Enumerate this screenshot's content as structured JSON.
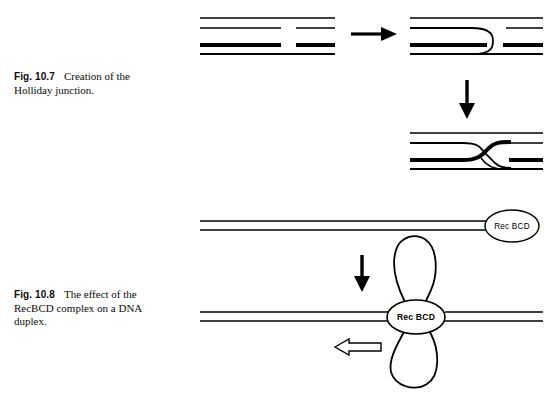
{
  "page": {
    "width": 547,
    "height": 398,
    "background": "#ffffff",
    "ink": "#000000"
  },
  "figures": [
    {
      "id": "fig-10-7",
      "number": "Fig. 10.7",
      "caption": "Creation of the Holliday junction.",
      "caption_line1": "Creation of the",
      "caption_line2": "Holliday junction.",
      "panels": [
        {
          "name": "parental-duplexes",
          "description": "Two separate DNA duplexes drawn as parallel line pairs; upper duplex drawn thin, lower duplex drawn thick; each carries a single-strand nick",
          "duplexes": [
            {
              "style": "thin",
              "nick_strand": "bottom"
            },
            {
              "style": "thick",
              "nick_strand": "top"
            }
          ]
        },
        {
          "name": "single-strand-invasion",
          "description": "Thin strand crosses over and pairs with the thick duplex forming a single crossover"
        },
        {
          "name": "holliday-junction",
          "description": "Reciprocal strand exchange producing the S-shaped Holliday junction"
        }
      ],
      "arrows": [
        {
          "name": "horizontal-arrow",
          "direction": "right",
          "style": "solid"
        },
        {
          "name": "vertical-arrow",
          "direction": "down",
          "style": "solid"
        }
      ]
    },
    {
      "id": "fig-10-8",
      "number": "Fig. 10.8",
      "caption": "The effect of the RecBCD complex on a DNA duplex.",
      "caption_line1": "The effect of the",
      "caption_line2": "RecBCD complex on a DNA",
      "caption_line3": "duplex.",
      "panels": [
        {
          "name": "recbcd-bound-duplex",
          "description": "Linear DNA duplex with the RecBCD complex bound at the right end",
          "enzyme_label": "Rec BCD"
        },
        {
          "name": "recbcd-looped-duplex",
          "description": "RecBCD translocating along the duplex, generating two single-stranded loops above and below the complex",
          "enzyme_label": "Rec BCD",
          "loops": 2,
          "translocation_arrow_label": "",
          "translocation_direction": "left"
        }
      ],
      "arrows": [
        {
          "name": "vertical-arrow",
          "direction": "down",
          "style": "solid"
        },
        {
          "name": "translocation-arrow",
          "direction": "left",
          "style": "open-outline"
        }
      ]
    }
  ],
  "labels": {
    "recbcd_top": "Rec BCD",
    "recbcd_bottom": "Rec BCD"
  }
}
